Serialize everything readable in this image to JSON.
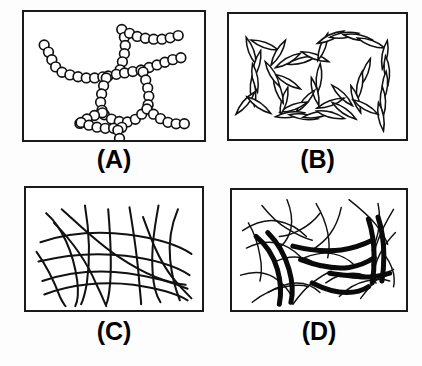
{
  "figure": {
    "background_color": "#fdfdfd",
    "ink_color": "#111111",
    "panel_border_color": "#1a1a1a",
    "layout": "2x2 grid of schematic microstructure panels"
  },
  "panels": [
    {
      "id": "panel-a",
      "label": "(A)",
      "position": {
        "x": 22,
        "y": 10,
        "width": 184,
        "height": 132
      },
      "label_y": 146,
      "structure_type": "bead-chain network",
      "description": "Open circles linked into strands forming a branched network with a central polygonal ring",
      "bead_radius": 5.0,
      "bead_count": 78,
      "chains": [
        {
          "name": "upper-left-arm",
          "points": [
            [
              20,
              34
            ],
            [
              26,
              44
            ],
            [
              30,
              55
            ],
            [
              38,
              62
            ],
            [
              50,
              66
            ],
            [
              62,
              68
            ],
            [
              74,
              68
            ],
            [
              86,
              66
            ]
          ]
        },
        {
          "name": "upper-center-branch",
          "points": [
            [
              100,
              18
            ],
            [
              104,
              30
            ],
            [
              103,
              42
            ],
            [
              100,
              54
            ],
            [
              97,
              64
            ]
          ]
        },
        {
          "name": "upper-right-arm",
          "points": [
            [
              108,
              22
            ],
            [
              118,
              26
            ],
            [
              130,
              28
            ],
            [
              142,
              28
            ],
            [
              154,
              26
            ],
            [
              164,
              22
            ]
          ]
        },
        {
          "name": "right-upper-arm",
          "points": [
            [
              120,
              60
            ],
            [
              132,
              56
            ],
            [
              144,
              52
            ],
            [
              156,
              48
            ],
            [
              168,
              46
            ]
          ]
        },
        {
          "name": "ring-top-left",
          "points": [
            [
              86,
              66
            ],
            [
              96,
              64
            ],
            [
              108,
              62
            ],
            [
              120,
              60
            ]
          ]
        },
        {
          "name": "ring-left",
          "points": [
            [
              84,
              68
            ],
            [
              80,
              80
            ],
            [
              78,
              92
            ],
            [
              80,
              104
            ]
          ]
        },
        {
          "name": "ring-right",
          "points": [
            [
              122,
              62
            ],
            [
              126,
              74
            ],
            [
              128,
              86
            ],
            [
              127,
              98
            ]
          ]
        },
        {
          "name": "ring-bottom",
          "points": [
            [
              82,
              106
            ],
            [
              92,
              112
            ],
            [
              104,
              114
            ],
            [
              116,
              110
            ],
            [
              126,
              100
            ]
          ]
        },
        {
          "name": "lower-left-arm",
          "points": [
            [
              80,
              104
            ],
            [
              68,
              108
            ],
            [
              58,
              114
            ],
            [
              50,
              120
            ]
          ]
        },
        {
          "name": "lower-center-chain",
          "points": [
            [
              58,
              114
            ],
            [
              70,
              118
            ],
            [
              82,
              120
            ],
            [
              94,
              120
            ],
            [
              106,
              118
            ]
          ]
        },
        {
          "name": "lower-stub",
          "points": [
            [
              96,
              122
            ],
            [
              98,
              132
            ],
            [
              100,
              142
            ]
          ]
        },
        {
          "name": "lower-right-arm",
          "points": [
            [
              126,
              100
            ],
            [
              136,
              108
            ],
            [
              148,
              114
            ],
            [
              160,
              116
            ],
            [
              172,
              114
            ]
          ]
        }
      ]
    },
    {
      "id": "panel-b",
      "label": "(B)",
      "position": {
        "x": 227,
        "y": 12,
        "width": 181,
        "height": 129
      },
      "label_y": 146,
      "structure_type": "rod / ellipsoid chains",
      "description": "Elongated lens-shaped particles joined end-to-end into loosely connected chains",
      "rod_length": 15,
      "rod_width": 5.5,
      "rod_count": 40,
      "rods": [
        {
          "cx": 22,
          "cy": 38,
          "angle": 70
        },
        {
          "cx": 28,
          "cy": 52,
          "angle": 105
        },
        {
          "cx": 26,
          "cy": 66,
          "angle": 80
        },
        {
          "cx": 24,
          "cy": 80,
          "angle": 85
        },
        {
          "cx": 16,
          "cy": 92,
          "angle": 130
        },
        {
          "cx": 30,
          "cy": 94,
          "angle": 35
        },
        {
          "cx": 36,
          "cy": 32,
          "angle": 20
        },
        {
          "cx": 50,
          "cy": 40,
          "angle": 120
        },
        {
          "cx": 60,
          "cy": 48,
          "angle": 150
        },
        {
          "cx": 74,
          "cy": 48,
          "angle": 165
        },
        {
          "cx": 88,
          "cy": 44,
          "angle": 20
        },
        {
          "cx": 96,
          "cy": 34,
          "angle": 110
        },
        {
          "cx": 104,
          "cy": 24,
          "angle": 155
        },
        {
          "cx": 118,
          "cy": 22,
          "angle": 172
        },
        {
          "cx": 132,
          "cy": 24,
          "angle": 10
        },
        {
          "cx": 146,
          "cy": 30,
          "angle": 20
        },
        {
          "cx": 160,
          "cy": 42,
          "angle": 100
        },
        {
          "cx": 162,
          "cy": 58,
          "angle": 85
        },
        {
          "cx": 160,
          "cy": 74,
          "angle": 95
        },
        {
          "cx": 158,
          "cy": 90,
          "angle": 88
        },
        {
          "cx": 156,
          "cy": 106,
          "angle": 80
        },
        {
          "cx": 140,
          "cy": 60,
          "angle": 110
        },
        {
          "cx": 134,
          "cy": 74,
          "angle": 100
        },
        {
          "cx": 130,
          "cy": 88,
          "angle": 70
        },
        {
          "cx": 140,
          "cy": 96,
          "angle": 30
        },
        {
          "cx": 116,
          "cy": 84,
          "angle": 45
        },
        {
          "cx": 104,
          "cy": 92,
          "angle": 160
        },
        {
          "cx": 92,
          "cy": 66,
          "angle": 95
        },
        {
          "cx": 88,
          "cy": 80,
          "angle": 75
        },
        {
          "cx": 78,
          "cy": 90,
          "angle": 130
        },
        {
          "cx": 66,
          "cy": 96,
          "angle": 160
        },
        {
          "cx": 56,
          "cy": 90,
          "angle": 105
        },
        {
          "cx": 50,
          "cy": 78,
          "angle": 70
        },
        {
          "cx": 60,
          "cy": 70,
          "angle": 30
        },
        {
          "cx": 62,
          "cy": 104,
          "angle": 172
        },
        {
          "cx": 76,
          "cy": 106,
          "angle": 8
        },
        {
          "cx": 90,
          "cy": 104,
          "angle": 170
        },
        {
          "cx": 104,
          "cy": 104,
          "angle": 15
        },
        {
          "cx": 118,
          "cy": 100,
          "angle": 35
        },
        {
          "cx": 44,
          "cy": 62,
          "angle": 60
        }
      ]
    },
    {
      "id": "panel-c",
      "label": "(C)",
      "position": {
        "x": 24,
        "y": 186,
        "width": 180,
        "height": 126
      },
      "label_y": 318,
      "structure_type": "entangled filament mesh",
      "description": "Thin uniform curved filaments crossing each other to form an entangled isotropic network",
      "filament_count": 14,
      "filaments": [
        "M 20,26 C 36,40 48,66 52,96 C 54,112 52,118 50,122",
        "M 36,22 C 54,38 74,58 96,72 C 120,88 142,98 164,100",
        "M 60,18 C 64,42 66,70 62,98 C 60,110 58,116 56,120",
        "M 84,22 C 86,46 88,72 86,98 C 85,110 84,116 82,120",
        "M 106,20 C 110,44 114,70 116,96 C 117,110 118,116 118,120",
        "M 136,18 C 132,40 128,64 130,88 C 131,104 134,112 138,118",
        "M 156,22 C 150,36 146,54 148,74 C 150,94 154,106 158,116",
        "M 14,56 C 38,48 70,44 104,48 C 136,52 158,60 170,68",
        "M 12,76 C 36,70 68,66 102,70 C 134,74 156,82 168,90",
        "M 16,96 C 40,88 72,84 104,88 C 132,92 152,98 166,104",
        "M 18,110 C 44,100 78,96 110,100 C 138,104 156,110 166,116",
        "M 28,36 C 46,54 62,76 72,100 C 78,112 80,118 82,122",
        "M 120,30 C 128,52 136,74 150,92 C 160,104 166,110 170,114",
        "M 10,66 C 20,80 28,96 34,112 C 37,118 38,120 40,122"
      ]
    },
    {
      "id": "panel-d",
      "label": "(D)",
      "position": {
        "x": 230,
        "y": 188,
        "width": 178,
        "height": 124
      },
      "label_y": 318,
      "structure_type": "bundled fiber network",
      "description": "Thin fibers converging and aggregating into thick dark bundles separated by open pores",
      "thin_fiber_count": 22,
      "bundle_count": 8,
      "thin_fibers": [
        "M 10,42 C 22,34 34,30 46,32 C 58,34 68,40 76,48",
        "M 14,60 C 26,54 38,52 50,56 C 60,60 68,66 74,74",
        "M 8,88 C 20,84 32,84 42,90 C 52,96 58,104 62,112",
        "M 30,16 C 38,26 46,34 56,40 C 66,46 74,50 82,52",
        "M 56,10 C 60,20 62,30 60,40 C 58,48 54,54 50,58",
        "M 86,14 C 92,24 96,34 98,44 C 100,54 100,62 98,70",
        "M 112,18 C 110,28 106,38 100,46 C 94,54 88,58 82,62",
        "M 120,10 C 130,18 140,26 148,36 C 154,44 158,50 160,56",
        "M 150,14 C 152,24 152,34 150,44 C 148,52 146,58 144,62",
        "M 166,20 C 160,30 154,40 150,52 C 146,62 144,70 144,78",
        "M 36,106 C 46,100 56,96 66,96 C 76,96 84,100 90,106",
        "M 20,116 C 30,108 42,102 54,100 C 64,98 72,98 78,100",
        "M 96,96 C 104,90 114,86 124,86 C 134,86 142,90 148,96",
        "M 110,110 C 118,102 128,96 138,94 C 148,92 156,92 162,94",
        "M 62,118 C 68,110 74,102 82,96 C 90,90 96,86 102,84",
        "M 132,112 C 138,104 144,96 152,90 C 158,86 162,84 166,82",
        "M 74,70 C 84,66 94,64 104,66 C 114,68 120,72 126,78",
        "M 44,74 C 52,70 62,68 72,70 C 80,72 86,76 90,80",
        "M 154,64 C 160,70 164,78 166,86 C 167,92 167,96 166,100",
        "M 16,34 C 22,44 26,56 28,68 C 30,78 30,86 28,94",
        "M 90,24 C 84,32 76,38 68,42 C 60,46 54,48 48,48",
        "M 168,44 C 162,50 156,58 152,66 C 148,74 146,80 146,86"
      ],
      "bundles": [
        "M 24,48 C 34,56 42,68 46,82 C 50,96 50,108 48,118",
        "M 36,44 C 46,54 54,68 58,82 C 62,96 62,108 60,116",
        "M 62,58 C 78,62 96,64 112,62 C 126,60 136,56 144,52",
        "M 70,72 C 86,78 104,82 120,80 C 132,78 140,74 146,70",
        "M 140,30 C 144,42 146,56 146,70 C 146,82 145,90 144,96",
        "M 150,28 C 154,40 156,54 156,68 C 156,80 155,88 154,94",
        "M 100,86 C 114,88 128,90 140,90 C 150,90 156,88 162,86",
        "M 82,96 C 94,102 106,106 118,106 C 128,106 134,104 140,100"
      ]
    }
  ]
}
